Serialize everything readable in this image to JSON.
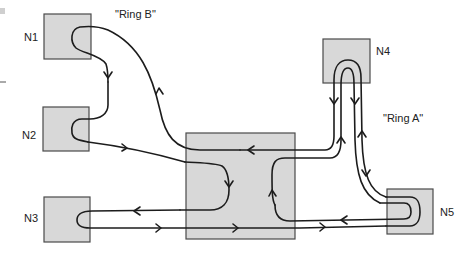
{
  "diagram": {
    "colors": {
      "box_fill": "#d8d8d8",
      "box_stroke": "#4a4a4a",
      "wire": "#1c1c1c",
      "label": "#222222",
      "background": "#ffffff"
    },
    "ring_labels": {
      "ring_b": "\"Ring B\"",
      "ring_a": "\"Ring A\""
    },
    "nodes": [
      {
        "id": "N1",
        "label": "N1",
        "x": 44,
        "y": 14,
        "w": 47,
        "h": 45,
        "label_x": 24,
        "label_y": 41
      },
      {
        "id": "N2",
        "label": "N2",
        "x": 43,
        "y": 107,
        "w": 46,
        "h": 44,
        "label_x": 22,
        "label_y": 139
      },
      {
        "id": "N3",
        "label": "N3",
        "x": 44,
        "y": 197,
        "w": 46,
        "h": 45,
        "label_x": 24,
        "label_y": 222
      },
      {
        "id": "HUB",
        "label": "",
        "x": 186,
        "y": 133,
        "w": 109,
        "h": 106
      },
      {
        "id": "N4",
        "label": "N4",
        "x": 323,
        "y": 39,
        "w": 47,
        "h": 44,
        "label_x": 376,
        "label_y": 55
      },
      {
        "id": "N5",
        "label": "N5",
        "x": 387,
        "y": 189,
        "w": 46,
        "h": 45,
        "label_x": 440,
        "label_y": 216
      }
    ]
  }
}
